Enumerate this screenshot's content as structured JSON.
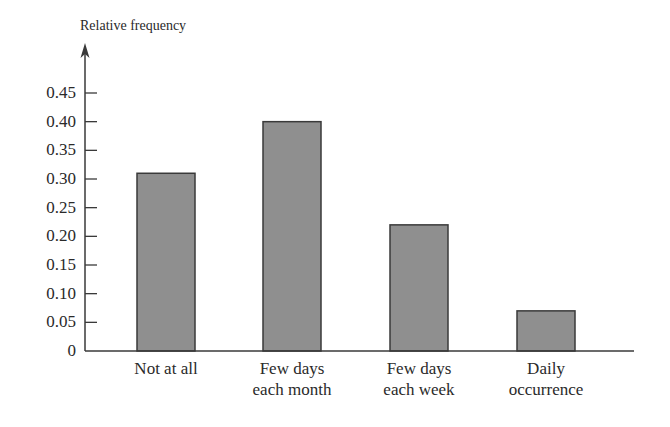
{
  "chart_data": {
    "type": "bar",
    "title": "",
    "xlabel": "",
    "ylabel": "Relative frequency",
    "categories": [
      [
        "Not at all"
      ],
      [
        "Few days",
        "each month"
      ],
      [
        "Few days",
        "each week"
      ],
      [
        "Daily",
        "occurrence"
      ]
    ],
    "category_names": [
      "Not at all",
      "Few days each month",
      "Few days each week",
      "Daily occurrence"
    ],
    "values": [
      0.31,
      0.4,
      0.22,
      0.07
    ],
    "ylim": [
      0,
      0.45
    ],
    "yticks": [
      0,
      0.05,
      0.1,
      0.15,
      0.2,
      0.25,
      0.3,
      0.35,
      0.4,
      0.45
    ],
    "ytick_labels": [
      "0",
      "0.05",
      "0.10",
      "0.15",
      "0.20",
      "0.25",
      "0.30",
      "0.35",
      "0.40",
      "0.45"
    ],
    "grid": false,
    "legend": null,
    "colors": {
      "bar_fill": "#8f8f8f",
      "bar_stroke": "#3a3a3a",
      "axis": "#3a3a3a",
      "text": "#2a2a2a"
    }
  }
}
